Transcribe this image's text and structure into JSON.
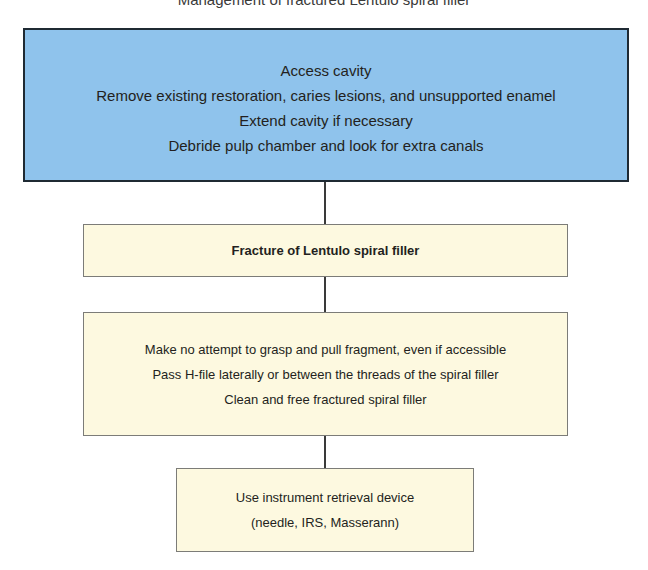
{
  "title": {
    "text": "Management of fractured Lentulo spiral filler"
  },
  "colors": {
    "top_box_fill": "#8fc3ec",
    "step_box_fill": "#fdf9e0",
    "top_box_border": "#1f2a33",
    "step_box_border": "#7c7c78",
    "connector": "#3a3a3a"
  },
  "flowchart": {
    "nodes": [
      {
        "id": "access",
        "lines": [
          "Access cavity",
          "Remove existing restoration, caries lesions, and unsupported enamel",
          "Extend cavity if necessary",
          "Debride pulp chamber and look for extra canals"
        ]
      },
      {
        "id": "fracture",
        "lines": [
          "Fracture of Lentulo spiral filler"
        ]
      },
      {
        "id": "bypass",
        "lines": [
          "Make no attempt to grasp and pull fragment, even if accessible",
          "Pass H-file laterally or between the threads of the spiral filler",
          "Clean and free fractured spiral filler"
        ]
      },
      {
        "id": "retrieval",
        "lines": [
          "Use instrument retrieval device",
          "(needle, IRS, Masserann)"
        ]
      }
    ],
    "edges": [
      {
        "from": "access",
        "to": "fracture"
      },
      {
        "from": "fracture",
        "to": "bypass"
      },
      {
        "from": "bypass",
        "to": "retrieval"
      }
    ]
  }
}
